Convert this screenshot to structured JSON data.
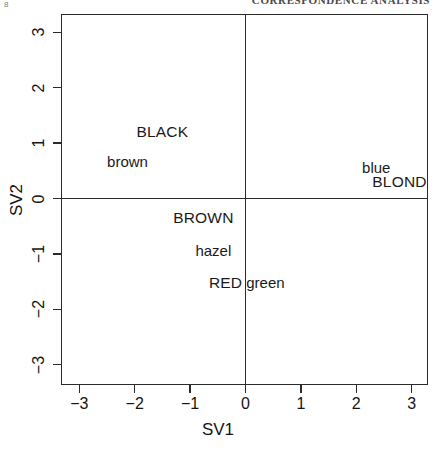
{
  "page": {
    "corner_mark": "8",
    "running_head": "CORRESPONDENCE ANALYSIS"
  },
  "chart_data": {
    "type": "scatter",
    "title": "",
    "xlabel": "SV1",
    "ylabel": "SV2",
    "xlim": [
      -3.35,
      3.35
    ],
    "ylim": [
      -3.35,
      3.35
    ],
    "grid": false,
    "legend": "none",
    "axis_lines_at_zero": true,
    "marker_style": "text-labels-only",
    "xticks": [
      -3,
      -2,
      -1,
      0,
      1,
      2,
      3
    ],
    "xticklabels": [
      "−3",
      "−2",
      "−1",
      "0",
      "1",
      "2",
      "3"
    ],
    "yticks": [
      -3,
      -2,
      -1,
      0,
      1,
      2,
      3
    ],
    "yticklabels": [
      "−3",
      "−2",
      "−1",
      "0",
      "1",
      "2",
      "3"
    ],
    "points": [
      {
        "label": "BLACK",
        "x": -1.5,
        "y": 1.22,
        "case": "upper",
        "group": "hair"
      },
      {
        "label": "brown",
        "x": -2.13,
        "y": 0.67,
        "case": "lower",
        "group": "eye"
      },
      {
        "label": "blue",
        "x": 2.36,
        "y": 0.56,
        "case": "lower",
        "group": "eye"
      },
      {
        "label": "BLOND",
        "x": 2.78,
        "y": 0.31,
        "case": "upper",
        "group": "hair"
      },
      {
        "label": "BROWN",
        "x": -0.76,
        "y": -0.33,
        "case": "upper",
        "group": "hair"
      },
      {
        "label": "hazel",
        "x": -0.58,
        "y": -0.93,
        "case": "lower",
        "group": "eye"
      },
      {
        "label": "RED",
        "x": -0.36,
        "y": -1.51,
        "case": "upper",
        "group": "hair"
      },
      {
        "label": "green",
        "x": 0.36,
        "y": -1.51,
        "case": "lower",
        "group": "eye"
      }
    ]
  },
  "colors": {
    "axis": "#2b2b2b",
    "text": "#141414",
    "background": "#ffffff"
  }
}
